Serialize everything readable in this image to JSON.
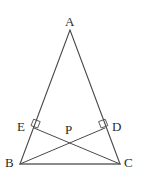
{
  "figure": {
    "name": "isosceles-triangle-with-two-altitudes",
    "canvas": {
      "width": 142,
      "height": 189
    },
    "background_color": "#ffffff",
    "stroke_color": "#4a4a4a",
    "base_stroke_color": "#8a8a8a",
    "label_color": "#2b2b2b",
    "stroke_width": 1,
    "points": {
      "A": {
        "x": 70,
        "y": 30,
        "label": "A",
        "label_x": 65,
        "label_y": 15
      },
      "B": {
        "x": 20,
        "y": 164,
        "label": "B",
        "label_x": 5,
        "label_y": 156
      },
      "C": {
        "x": 120,
        "y": 164,
        "label": "C",
        "label_x": 124,
        "label_y": 156
      },
      "D": {
        "x": 105,
        "y": 128,
        "label": "D",
        "label_x": 112,
        "label_y": 120
      },
      "E": {
        "x": 34,
        "y": 128,
        "label": "E",
        "label_x": 17,
        "label_y": 120
      },
      "P": {
        "x": 70,
        "y": 141,
        "label": "P",
        "label_x": 65,
        "label_y": 123
      }
    },
    "segments": [
      {
        "name": "side-AB",
        "from": "A",
        "to": "B",
        "style": "plain"
      },
      {
        "name": "side-AC",
        "from": "A",
        "to": "C",
        "style": "plain"
      },
      {
        "name": "side-BC",
        "from": "B",
        "to": "C",
        "style": "base"
      },
      {
        "name": "cevian-BD",
        "from": "B",
        "to": "D",
        "style": "plain"
      },
      {
        "name": "cevian-CE",
        "from": "C",
        "to": "E",
        "style": "plain"
      }
    ],
    "right_angle_marks": [
      {
        "name": "right-angle-mark-at-E",
        "at": "E",
        "points": "31.0,125.6 33.6,119.2 40.2,121.6 37.6,128.0"
      },
      {
        "name": "right-angle-mark-at-D",
        "at": "D",
        "points": "107.8,125.6 105.2,119.2 98.6,121.6 101.2,128.0"
      }
    ]
  }
}
